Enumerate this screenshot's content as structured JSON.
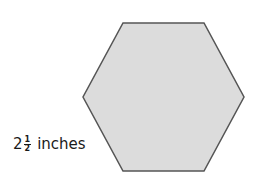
{
  "figure": {
    "shape": "regular-hexagon",
    "fill_color": "#dcdcdc",
    "stroke_color": "#555555",
    "side_label": {
      "whole": "2",
      "numerator": "1",
      "denominator": "2",
      "unit": "inches"
    }
  }
}
